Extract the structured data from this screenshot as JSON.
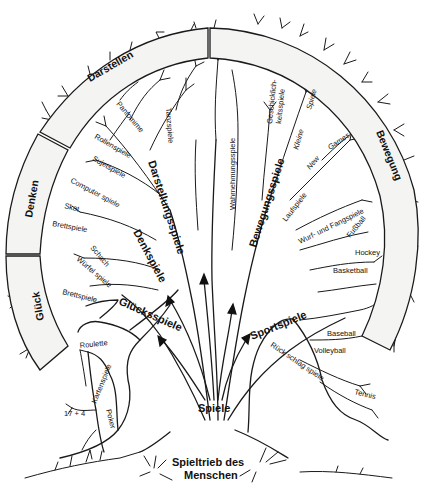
{
  "diagram": {
    "title": "Spieltrieb des Menschen",
    "root": {
      "label_line1": "Spieltrieb des",
      "label_line2": "Menschen"
    },
    "trunk_label": "Spiele",
    "ring_segments": [
      {
        "id": "glueck",
        "label": "Glück"
      },
      {
        "id": "denken",
        "label": "Denken"
      },
      {
        "id": "darstellen",
        "label": "Darstellen"
      },
      {
        "id": "bewegung",
        "label": "Bewegung"
      }
    ],
    "main_branches": {
      "gluecksspiele": "Glücksspiele",
      "denkspiele": "Denkspiele",
      "darstellungsspiele": "Darstellungsspiele",
      "wahrnehmungsspiele": "Wahrnehmungsspiele",
      "bewegungsspiele": "Bewegungsspiele",
      "sportspiele": "Sportspiele"
    },
    "sub_branches": {
      "tanzspiele": "Tanzspiele",
      "pantomime": "Pantomime",
      "rollenspiele": "Rollenspiele",
      "sujetspiele": "Sujetspiele",
      "computerspiele": "Computer spiele",
      "skat": "Skat",
      "brettspiele_denken": "Brettspiele",
      "schach": "Schach",
      "wuerfelspiele": "Würfel spiele",
      "brettspiele_glueck": "Brettspiele",
      "roulette": "Roulette",
      "kartenspiele": "Kartenspiele",
      "siebzehn_und_vier": "17 + 4",
      "poker": "Poker",
      "geschicklichkeitsspiele_l1": "Geschicklich-",
      "geschicklichkeitsspiele_l2": "keitsspiele",
      "kleine_spiele_1": "Kleine",
      "kleine_spiele_2": "Spiele",
      "new_games_1": "New",
      "new_games_2": "Games",
      "laufspiele": "Laufspiele",
      "wurf_und_fangspiele": "Wurf- und Fangspiele",
      "fussball": "Fußball",
      "hockey": "Hockey",
      "basketball": "Basketball",
      "baseball": "Baseball",
      "volleyball": "Volleyball",
      "rueckschlagspiele": "Rück schlag spiele",
      "tennis": "Tennis"
    },
    "colors": {
      "ink": "#1a1a1a",
      "ring_fill": "#f4f4f2",
      "background": "#ffffff"
    }
  }
}
